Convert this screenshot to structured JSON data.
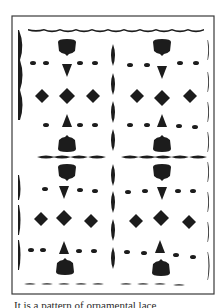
{
  "figure": {
    "colors": {
      "ink": "#1c1c1c",
      "paper": "#ffffff",
      "frame": "#3a3a3a"
    },
    "frame": {
      "x": 12,
      "y": 16,
      "w": 202,
      "h": 278
    },
    "axis": {
      "vertical_x": 113,
      "horizontal_y": 157
    },
    "motif_columns": [
      67,
      162
    ],
    "diamond_columns": [
      [
        42,
        67,
        93
      ],
      [
        137,
        162,
        190
      ]
    ],
    "rows": {
      "top_border": 29,
      "block_top": 48,
      "dots_upper": 63,
      "diamonds_upper": 96,
      "dots_mid_upper": 125,
      "block_mid_upper": 143,
      "center": 157,
      "block_mid_lower": 173,
      "dots_mid_lower": 191,
      "diamonds_lower": 219,
      "dots_lower": 250,
      "block_lower": 264,
      "bottom_dashes": 283
    }
  },
  "caption": {
    "text": "It is a pattern of ornamental lace"
  }
}
